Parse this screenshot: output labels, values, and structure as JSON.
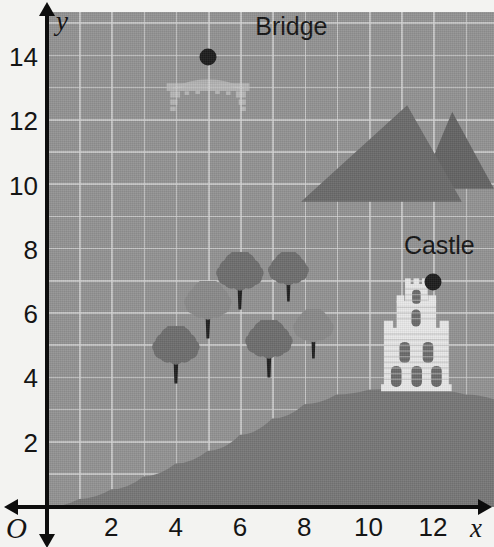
{
  "figure": {
    "type": "scene-map",
    "width": 494,
    "height": 547
  },
  "axes": {
    "origin_label": "O",
    "x_axis_name": "x",
    "y_axis_name": "y",
    "x_ticks": [
      "2",
      "4",
      "6",
      "8",
      "10",
      "12"
    ],
    "x_tick_values": [
      2,
      4,
      6,
      8,
      10,
      12
    ],
    "y_ticks": [
      "2",
      "4",
      "6",
      "8",
      "10",
      "12",
      "14"
    ],
    "y_tick_values": [
      2,
      4,
      6,
      8,
      10,
      12,
      14
    ],
    "x_range": [
      0,
      13.9
    ],
    "y_range": [
      0,
      15.4
    ],
    "grid": true,
    "grid_step": 1
  },
  "colors": {
    "background": "#f3f3f1",
    "plot_background": "#939393",
    "gridline": "#d7d7d7",
    "ground": "#777777",
    "mountain": "#6b6b6b",
    "mountain_shadow": "#646464",
    "tree_canopy_dark": "#6e6e6e",
    "tree_canopy_light": "#8a8a8a",
    "tree_trunk": "#1f1f1f",
    "castle_wall": "#e8e8e8",
    "castle_window": "#6a6a6a",
    "bridge": "#b9b9b9",
    "marker": "#1d1d1d",
    "axis": "#0d0d0d",
    "text": "#151515"
  },
  "places": [
    {
      "name": "bridge",
      "label": "Bridge",
      "marker_x": 5,
      "marker_y": 14,
      "label_x": 7.6,
      "label_y": 14.55
    },
    {
      "name": "castle",
      "label": "Castle",
      "marker_x": 12,
      "marker_y": 7,
      "label_x": 12.2,
      "label_y": 7.75
    }
  ],
  "features": {
    "mountains": [
      {
        "name": "mountain-left",
        "peak_x": 11.2,
        "peak_y": 12.5,
        "base_left_x": 7.9,
        "base_right_x": 12.9,
        "base_y": 9.5
      },
      {
        "name": "mountain-right",
        "peak_x": 12.6,
        "peak_y": 12.3,
        "base_left_x": 11.6,
        "base_right_x": 13.9,
        "base_y": 9.9
      }
    ],
    "trees": [
      {
        "name": "tree-1",
        "x": 4.0,
        "y": 4.3,
        "size": "large",
        "shade": "dark"
      },
      {
        "name": "tree-2",
        "x": 5.0,
        "y": 5.7,
        "size": "large",
        "shade": "light"
      },
      {
        "name": "tree-3",
        "x": 6.0,
        "y": 6.6,
        "size": "large",
        "shade": "dark"
      },
      {
        "name": "tree-4",
        "x": 6.9,
        "y": 4.5,
        "size": "large",
        "shade": "dark"
      },
      {
        "name": "tree-5",
        "x": 7.5,
        "y": 6.8,
        "size": "mid",
        "shade": "dark"
      },
      {
        "name": "tree-6",
        "x": 8.3,
        "y": 5.0,
        "size": "mid",
        "shade": "light"
      }
    ],
    "castle_structure": {
      "name": "castle-building",
      "base_x": 11.5,
      "base_y": 3.55,
      "width": 2.2,
      "height": 3.6
    },
    "bridge_structure": {
      "name": "bridge-span",
      "left_x": 3.6,
      "right_x": 6.4,
      "deck_y": 13.4
    },
    "ground": {
      "name": "ground-hill",
      "description": "hill rising left to right, flat low plain on left, crest beneath the castle",
      "points": [
        [
          0,
          0.0
        ],
        [
          1.0,
          0.25
        ],
        [
          2.0,
          0.55
        ],
        [
          3.0,
          0.95
        ],
        [
          4.0,
          1.35
        ],
        [
          5.0,
          1.75
        ],
        [
          6.0,
          2.25
        ],
        [
          7.0,
          2.75
        ],
        [
          8.0,
          3.2
        ],
        [
          9.0,
          3.5
        ],
        [
          10.0,
          3.65
        ],
        [
          11.0,
          3.7
        ],
        [
          12.0,
          3.65
        ],
        [
          13.0,
          3.5
        ],
        [
          13.9,
          3.35
        ]
      ]
    }
  },
  "chart_data": {
    "type": "scatter",
    "title": "",
    "xlabel": "x",
    "ylabel": "y",
    "xlim": [
      0,
      13.9
    ],
    "ylim": [
      0,
      15.4
    ],
    "grid": true,
    "points": [
      {
        "label": "Bridge",
        "x": 5,
        "y": 14
      },
      {
        "label": "Castle",
        "x": 12,
        "y": 7
      }
    ]
  }
}
